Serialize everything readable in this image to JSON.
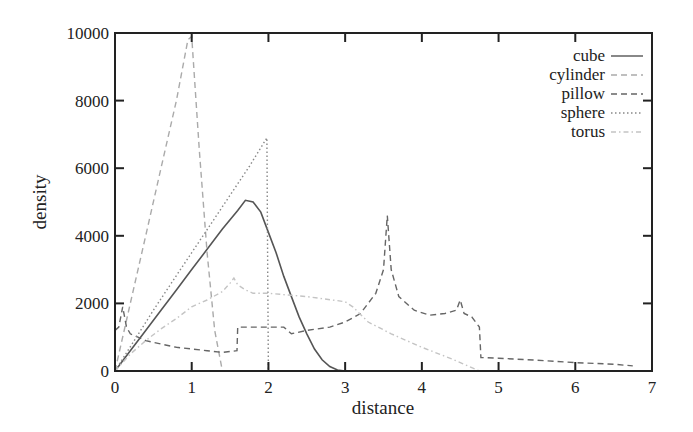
{
  "chart_data": {
    "type": "line",
    "title": "",
    "xlabel": "distance",
    "ylabel": "density",
    "xlim": [
      0,
      7
    ],
    "ylim": [
      0,
      10000
    ],
    "xticks": [
      0,
      1,
      2,
      3,
      4,
      5,
      6,
      7
    ],
    "yticks": [
      0,
      2000,
      4000,
      6000,
      8000,
      10000
    ],
    "grid": false,
    "legend_position": "upper right",
    "series": [
      {
        "name": "cube",
        "style": "solid",
        "color": "#555555",
        "x": [
          0,
          0.2,
          0.4,
          0.6,
          0.8,
          1.0,
          1.2,
          1.4,
          1.6,
          1.7,
          1.8,
          1.9,
          2.0,
          2.1,
          2.2,
          2.3,
          2.4,
          2.5,
          2.6,
          2.7,
          2.8,
          2.9,
          3.0
        ],
        "y": [
          0,
          600,
          1200,
          1800,
          2400,
          3000,
          3600,
          4200,
          4750,
          5050,
          5000,
          4700,
          4100,
          3500,
          2800,
          2200,
          1600,
          1100,
          650,
          330,
          130,
          30,
          0
        ]
      },
      {
        "name": "cylinder",
        "style": "dash",
        "color": "#aaaaaa",
        "x": [
          0,
          0.2,
          0.4,
          0.6,
          0.8,
          0.95,
          1.0,
          1.1,
          1.2,
          1.3,
          1.4
        ],
        "y": [
          0,
          2000,
          4000,
          6000,
          8000,
          9800,
          9900,
          6500,
          3500,
          1200,
          0
        ]
      },
      {
        "name": "pillow",
        "style": "dash",
        "color": "#666666",
        "x": [
          0,
          0.05,
          0.1,
          0.15,
          0.2,
          0.4,
          0.6,
          0.8,
          1.0,
          1.2,
          1.4,
          1.59,
          1.6,
          1.8,
          2.0,
          2.2,
          2.3,
          2.5,
          2.8,
          3.0,
          3.2,
          3.4,
          3.5,
          3.55,
          3.6,
          3.7,
          3.9,
          4.1,
          4.3,
          4.45,
          4.5,
          4.55,
          4.65,
          4.75,
          4.77,
          5.0,
          5.5,
          6.0,
          6.5,
          6.75
        ],
        "y": [
          1200,
          1300,
          1900,
          1300,
          1100,
          900,
          800,
          700,
          650,
          600,
          550,
          600,
          1300,
          1300,
          1300,
          1300,
          1100,
          1200,
          1300,
          1450,
          1700,
          2300,
          3000,
          4600,
          3000,
          2200,
          1800,
          1650,
          1700,
          1800,
          2100,
          1700,
          1600,
          1300,
          400,
          380,
          320,
          250,
          200,
          150
        ]
      },
      {
        "name": "sphere",
        "style": "dot",
        "color": "#888888",
        "x": [
          0,
          0.25,
          0.5,
          0.75,
          1.0,
          1.25,
          1.5,
          1.75,
          1.98,
          1.99,
          2.0
        ],
        "y": [
          0,
          900,
          1800,
          2650,
          3500,
          4350,
          5200,
          6050,
          6900,
          3000,
          0
        ]
      },
      {
        "name": "torus",
        "style": "dash-dot",
        "color": "#c4c4c4",
        "x": [
          0,
          0.2,
          0.4,
          0.6,
          0.8,
          1.0,
          1.2,
          1.4,
          1.5,
          1.55,
          1.6,
          1.7,
          1.8,
          2.0,
          2.5,
          3.0,
          3.1,
          3.3,
          3.6,
          4.0,
          4.4,
          4.75
        ],
        "y": [
          0,
          500,
          900,
          1250,
          1550,
          1900,
          2100,
          2350,
          2600,
          2750,
          2550,
          2400,
          2300,
          2300,
          2200,
          2050,
          1900,
          1450,
          1100,
          700,
          350,
          0
        ]
      }
    ]
  },
  "axes": {
    "xlabel": "distance",
    "ylabel": "density",
    "xtick_labels": [
      "0",
      "1",
      "2",
      "3",
      "4",
      "5",
      "6",
      "7"
    ],
    "ytick_labels": [
      "0",
      "2000",
      "4000",
      "6000",
      "8000",
      "10000"
    ]
  },
  "legend": {
    "items": [
      {
        "label": "cube",
        "style": "solid"
      },
      {
        "label": "cylinder",
        "style": "dash"
      },
      {
        "label": "pillow",
        "style": "dash"
      },
      {
        "label": "sphere",
        "style": "dot"
      },
      {
        "label": "torus",
        "style": "dash-dot"
      }
    ]
  }
}
